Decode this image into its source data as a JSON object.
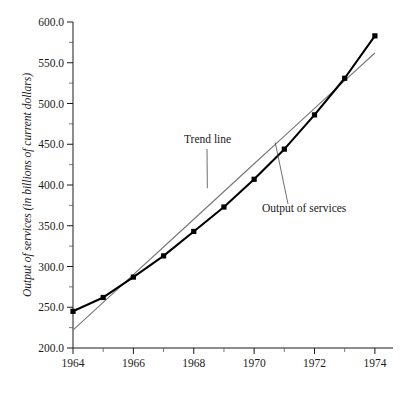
{
  "chart_data": {
    "type": "line",
    "title": "",
    "xlabel": "",
    "ylabel": "Output of services (in billions of current dollars)",
    "xlim": [
      1964,
      1974.6
    ],
    "ylim": [
      200.0,
      600.0
    ],
    "grid": false,
    "legend_position": "inline-annotations",
    "x": [
      1964,
      1965,
      1966,
      1967,
      1968,
      1969,
      1970,
      1971,
      1972,
      1973,
      1974
    ],
    "xtick_labels": [
      "1964",
      "1966",
      "1968",
      "1970",
      "1972",
      "1974"
    ],
    "xtick_values": [
      1964,
      1966,
      1968,
      1970,
      1972,
      1974
    ],
    "xtick_minor_values": [
      1965,
      1967,
      1969,
      1971,
      1973
    ],
    "ytick_labels": [
      "200.0",
      "250.0",
      "300.0",
      "350.0",
      "400.0",
      "450.0",
      "500.0",
      "550.0",
      "600.0"
    ],
    "ytick_values": [
      200.0,
      250.0,
      300.0,
      350.0,
      400.0,
      450.0,
      500.0,
      550.0,
      600.0
    ],
    "ytick_minor_values": [
      225.0,
      275.0,
      325.0,
      375.0,
      425.0,
      475.0,
      525.0,
      575.0
    ],
    "series": [
      {
        "name": "Output of services",
        "color": "#000000",
        "marker": "square",
        "values": [
          245.0,
          262.0,
          287.0,
          313.0,
          343.0,
          373.0,
          407.0,
          444.0,
          486.0,
          531.0,
          583.0
        ]
      },
      {
        "name": "Trend line",
        "color": "#7a7a7a",
        "marker": "none",
        "values": [
          222.0,
          256.0,
          290.0,
          324.0,
          358.0,
          392.0,
          426.0,
          460.0,
          494.0,
          528.0,
          562.0
        ]
      }
    ],
    "annotations": [
      {
        "text": "Trend line",
        "target_x": 1968.45,
        "target_y": 396.0
      },
      {
        "text": "Output of services",
        "target_x": 1970.7,
        "target_y": 452.0
      }
    ]
  }
}
